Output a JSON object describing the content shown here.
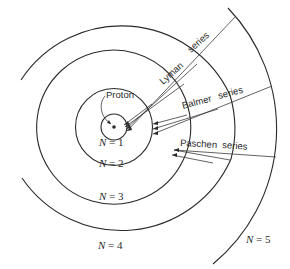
{
  "diagram": {
    "type": "bohr-model-hydrogen-spectral-series",
    "nucleus_label": "Proton",
    "levels": [
      {
        "n": 1,
        "label_var": "N",
        "label_eq": " = 1"
      },
      {
        "n": 2,
        "label_var": "N",
        "label_eq": " = 2"
      },
      {
        "n": 3,
        "label_var": "N",
        "label_eq": " = 3"
      },
      {
        "n": 4,
        "label_var": "N",
        "label_eq": " = 4"
      },
      {
        "n": 5,
        "label_var": "N",
        "label_eq": " = 5"
      }
    ],
    "series": [
      {
        "name": "Lyman",
        "suffix": "series",
        "final_level": 1
      },
      {
        "name": "Balmer",
        "suffix": "series",
        "final_level": 2
      },
      {
        "name": "Paschen",
        "suffix": "series",
        "final_level": 3
      }
    ],
    "colors": {
      "line": "#2a2a2a",
      "background": "#ffffff"
    }
  }
}
